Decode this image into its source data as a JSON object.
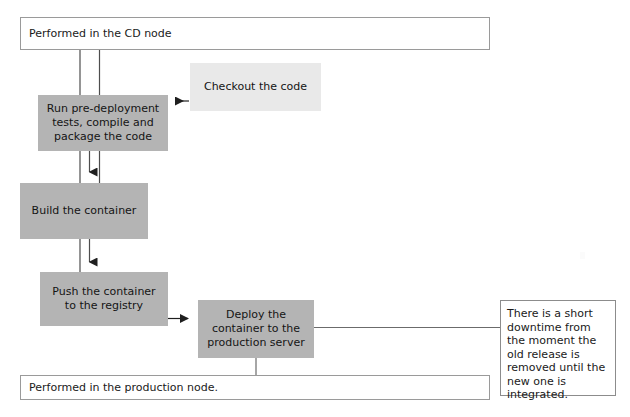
{
  "diagram": {
    "lanes": [
      {
        "id": "cd-node",
        "label": "Performed in the CD node"
      },
      {
        "id": "production-node",
        "label": "Performed in the production node."
      }
    ],
    "nodes": [
      {
        "id": "checkout",
        "label": "Checkout the code",
        "fill": "#e9e9e9"
      },
      {
        "id": "run",
        "label": "Run pre-deployment\ntests, compile and\npackage the code",
        "fill": "#b4b4b4"
      },
      {
        "id": "build",
        "label": "Build the container",
        "fill": "#b4b4b4"
      },
      {
        "id": "push",
        "label": "Push the container\nto the registry",
        "fill": "#b4b4b4"
      },
      {
        "id": "deploy",
        "label": "Deploy the\ncontainer to the\nproduction server",
        "fill": "#b4b4b4"
      }
    ],
    "note": {
      "id": "downtime-note",
      "label": "There is a short downtime from the moment the old release is removed until the new one is integrated."
    },
    "colors": {
      "process_fill": "#b4b4b4",
      "source_fill": "#e9e9e9",
      "lane_fill": "#ffffff",
      "lane_border": "#9a9a9a",
      "connector": "#4d4d4d",
      "text": "#1a1a1a"
    },
    "edges": [
      {
        "from": "checkout",
        "to": "run",
        "style": "arrow-left"
      },
      {
        "from": "run",
        "to": "build",
        "style": "arrow-down"
      },
      {
        "from": "build",
        "to": "push",
        "style": "arrow-down"
      },
      {
        "from": "push",
        "to": "deploy",
        "style": "arrow-right"
      },
      {
        "from": "deploy",
        "to": "production-node",
        "style": "line-down"
      },
      {
        "from": "deploy",
        "to": "downtime-note",
        "style": "line-right"
      },
      {
        "from": "cd-node",
        "to": "build",
        "style": "lane-rail"
      },
      {
        "from": "cd-node",
        "to": "push",
        "style": "lane-rail"
      }
    ]
  }
}
